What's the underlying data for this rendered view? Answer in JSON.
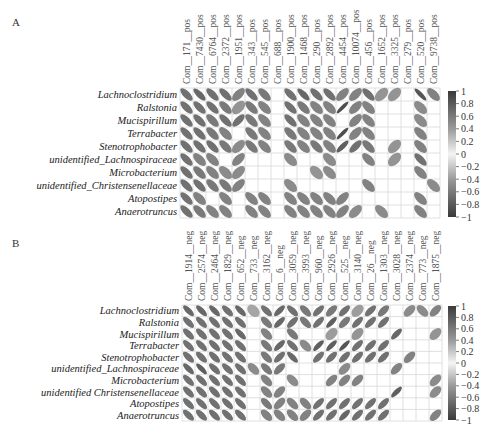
{
  "figure": {
    "caption": "",
    "panels": [
      "A",
      "B"
    ]
  },
  "chart_data": [
    {
      "type": "heatmap",
      "subtype": "correlation-ellipse",
      "panel": "A",
      "title": "",
      "rows": [
        "Lachnoclostridium",
        "Ralstonia",
        "Mucispirillum",
        "Terrabacter",
        "Stenotrophobacter",
        "unidentified_Lachnospiraceae",
        "Microbacterium",
        "unidentified_Christensenellaceae",
        "Atopostipes",
        "Anaerotruncus"
      ],
      "columns": [
        "Com__171__pos",
        "Com__7430__pos",
        "Com__6764__pos",
        "Com__2372__pos",
        "Com__1951__pos",
        "Com__343__pos",
        "Com__545__pos",
        "Com__688__pos",
        "Com__1900__pos",
        "Com__1468__pos",
        "Com__290__pos",
        "Com__2892__pos",
        "Com__4454__pos",
        "Com__10074__pos",
        "Com__456__pos",
        "Com__1652__pos",
        "Com__3325__pos",
        "Com__279__pos",
        "Com__520__pos",
        "Com__9738__pos"
      ],
      "values": [
        [
          -0.7,
          -0.75,
          -0.7,
          -0.7,
          0.6,
          -0.7,
          -0.65,
          0,
          -0.7,
          -0.75,
          -0.7,
          -0.7,
          0.6,
          0.6,
          -0.7,
          0.5,
          0.5,
          0,
          -0.85,
          -0.6
        ],
        [
          -0.7,
          -0.7,
          -0.7,
          -0.65,
          0.5,
          -0.65,
          -0.6,
          0,
          -0.7,
          -0.65,
          -0.6,
          -0.6,
          0.9,
          0.6,
          -0.6,
          0,
          0,
          0,
          -0.55,
          0
        ],
        [
          -0.7,
          -0.7,
          -0.65,
          -0.7,
          0.7,
          -0.65,
          -0.6,
          0,
          -0.7,
          -0.6,
          -0.6,
          -0.6,
          0,
          0.6,
          -0.6,
          0,
          0,
          0,
          -0.55,
          0
        ],
        [
          -0.7,
          -0.7,
          -0.65,
          -0.6,
          0,
          -0.65,
          -0.6,
          0,
          -0.65,
          -0.6,
          -0.6,
          -0.6,
          0.9,
          0.6,
          -0.6,
          0,
          0,
          0,
          -0.6,
          0
        ],
        [
          -0.7,
          -0.7,
          -0.7,
          -0.65,
          0.55,
          -0.65,
          -0.6,
          0,
          -0.65,
          -0.6,
          -0.65,
          -0.6,
          0.8,
          0.7,
          -0.65,
          0,
          0.5,
          0,
          -0.6,
          0
        ],
        [
          -0.7,
          -0.6,
          -0.6,
          0,
          0.6,
          0,
          0,
          0,
          -0.55,
          0,
          0,
          -0.55,
          0,
          0,
          -0.6,
          0,
          0.5,
          0,
          -0.7,
          0
        ],
        [
          -0.7,
          -0.65,
          -0.6,
          -0.55,
          0.55,
          0,
          0,
          0,
          0,
          0,
          -0.5,
          -0.55,
          0,
          0,
          0,
          0,
          0,
          0,
          -0.6,
          0
        ],
        [
          -0.7,
          -0.7,
          -0.65,
          -0.65,
          0.6,
          0,
          0,
          0,
          -0.55,
          0,
          0,
          0,
          0,
          0,
          -0.6,
          0,
          0,
          0,
          0,
          -0.55
        ],
        [
          -0.7,
          -0.6,
          0,
          -0.6,
          0,
          -0.6,
          -0.6,
          0,
          -0.6,
          -0.6,
          -0.6,
          -0.6,
          0.6,
          0,
          0,
          0,
          0,
          0,
          -0.6,
          0
        ],
        [
          -0.7,
          -0.65,
          -0.6,
          -0.6,
          0,
          -0.6,
          -0.6,
          0,
          -0.6,
          -0.6,
          -0.6,
          -0.6,
          0.6,
          0.55,
          0,
          -0.55,
          0,
          0,
          -0.6,
          0
        ]
      ],
      "color_scale": {
        "min": -1,
        "max": 1,
        "ticks": [
          "1",
          "0.8",
          "0.6",
          "0.4",
          "0.2",
          "0",
          "−0.2",
          "−0.4",
          "−0.6",
          "−0.8",
          "−1"
        ]
      },
      "legend_position": "right",
      "grid": true
    },
    {
      "type": "heatmap",
      "subtype": "correlation-ellipse",
      "panel": "B",
      "title": "",
      "rows": [
        "Lachnoclostridium",
        "Ralstonia",
        "Mucispirillum",
        "Terrabacter",
        "Stenotrophobacter",
        "unidentified_Lachnospiraceae",
        "Microbacterium",
        "unidentified Christensenellaceae",
        "Atopostipes",
        "Anaerotruncus"
      ],
      "columns": [
        "Com__1914__neg",
        "Com__2574__neg",
        "Com__2464__neg",
        "Com__1829__neg",
        "Com__652__neg",
        "Com__733__neg",
        "Com__3162__neg",
        "Com__6__neg",
        "Com__3059__neg",
        "Com__3993__neg",
        "Com__960__neg",
        "Com__2926__neg",
        "Com__525__neg",
        "Com__3140__neg",
        "Com__26__neg",
        "Com__1303__neg",
        "Com__3028__neg",
        "Com__2374__neg",
        "Com__773__neg",
        "Com__1875__neg"
      ],
      "values": [
        [
          -0.75,
          -0.75,
          -0.75,
          -0.7,
          -0.75,
          -0.4,
          -0.7,
          0.75,
          -0.7,
          -0.65,
          0.7,
          0.65,
          0.7,
          0.45,
          0.7,
          0.65,
          0,
          0.55,
          -0.55,
          0.6
        ],
        [
          -0.7,
          -0.7,
          -0.7,
          -0.7,
          -0.7,
          0,
          -0.65,
          0.75,
          0.7,
          -0.65,
          0.7,
          0.8,
          0.65,
          0.7,
          0.7,
          0.7,
          0,
          0,
          0,
          0
        ],
        [
          -0.7,
          -0.7,
          -0.7,
          -0.7,
          -0.75,
          0,
          -0.6,
          0,
          -0.65,
          0,
          0,
          0.45,
          0,
          0.5,
          0,
          0,
          0.75,
          0,
          0,
          0.5
        ],
        [
          -0.7,
          -0.7,
          -0.7,
          -0.7,
          -0.7,
          0,
          -0.65,
          0.75,
          -0.7,
          -0.55,
          0.8,
          0.8,
          0.85,
          0.7,
          0.7,
          0.7,
          0,
          0,
          0,
          0
        ],
        [
          -0.7,
          -0.7,
          -0.7,
          -0.7,
          -0.7,
          0,
          -0.65,
          0.7,
          -0.75,
          0,
          0.7,
          0.7,
          0.7,
          0.7,
          0.7,
          0.7,
          0,
          0.6,
          0,
          0
        ],
        [
          -0.75,
          -0.8,
          -0.7,
          -0.7,
          -0.7,
          -0.55,
          -0.65,
          0.65,
          0,
          0,
          0,
          0,
          0.55,
          0,
          0,
          0,
          0.6,
          0,
          0,
          0
        ],
        [
          -0.7,
          -0.7,
          -0.7,
          -0.7,
          -0.7,
          0,
          -0.6,
          0,
          -0.55,
          0,
          0,
          0.6,
          0.6,
          0.6,
          0,
          0,
          0,
          0,
          0,
          0.55
        ],
        [
          -0.7,
          -0.7,
          -0.7,
          -0.7,
          -0.7,
          0,
          -0.6,
          0.6,
          0,
          0,
          0,
          0,
          0,
          0,
          0,
          0,
          0.8,
          0,
          0,
          0.55
        ],
        [
          -0.7,
          -0.7,
          -0.7,
          -0.7,
          -0.7,
          0,
          -0.65,
          0.6,
          -0.6,
          -0.6,
          0.7,
          0.7,
          0.7,
          0.7,
          0.7,
          0.7,
          0,
          0,
          0,
          0
        ],
        [
          -0.7,
          -0.7,
          -0.7,
          -0.7,
          -0.7,
          0,
          -0.6,
          -0.6,
          -0.6,
          0.6,
          0.7,
          0.7,
          0.75,
          0.7,
          0.7,
          0.7,
          0,
          0,
          0,
          0.6
        ]
      ],
      "color_scale": {
        "min": -1,
        "max": 1,
        "ticks": [
          "1",
          "0.8",
          "0.6",
          "0.4",
          "0.2",
          "0",
          "−0.2",
          "−0.4",
          "−0.6",
          "−0.8",
          "−1"
        ]
      },
      "legend_position": "right",
      "grid": true
    }
  ]
}
